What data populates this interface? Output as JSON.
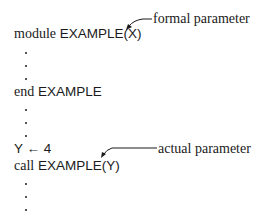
{
  "figure": {
    "annotations": {
      "formal": "formal parameter",
      "actual": "actual parameter"
    },
    "lines": {
      "module_kw": "module",
      "module_name": "EXAMPLE(X)",
      "end_kw": "end",
      "end_name": "EXAMPLE",
      "assign": "Y ← 4",
      "call_kw": "call",
      "call_name": "EXAMPLE(Y)"
    },
    "ellipsis_dot": "."
  }
}
